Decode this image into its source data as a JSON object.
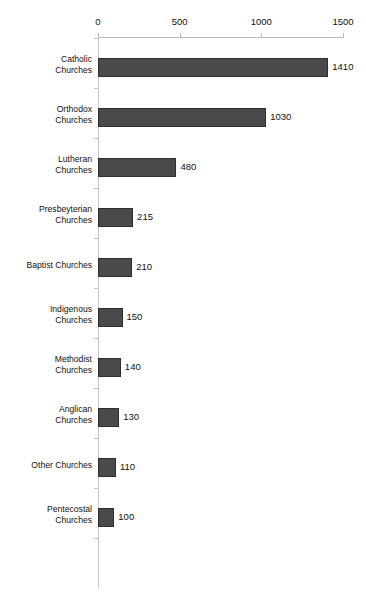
{
  "chart_data": {
    "type": "bar",
    "orientation": "horizontal",
    "title": "",
    "xlabel": "",
    "ylabel": "",
    "xlim": [
      0,
      1500
    ],
    "xticks": [
      0,
      500,
      1000,
      1500
    ],
    "xtick_labels": [
      "0",
      "500",
      "1000",
      "1500"
    ],
    "grid": false,
    "legend": "none",
    "axis_position": "top",
    "bar_color": "#4a4a4a",
    "bar_border_color": "#2e2e2e",
    "axis_color": "#b9b9b9",
    "background": "#ffffff",
    "show_value_labels": true,
    "categories": [
      "Catholic Churches",
      "Orthodox Churches",
      "Lutheran Churches",
      "Presbeyterian Churches",
      "Baptist Churches",
      "Indigenous Churches",
      "Methodist Churches",
      "Anglican Churches",
      "Other Churches",
      "Pentecostal Churches"
    ],
    "values": [
      1410,
      1030,
      480,
      215,
      210,
      150,
      140,
      130,
      110,
      100
    ],
    "bars": [
      {
        "label_line1": "Catholic",
        "label_line2": "Churches",
        "value": 1410,
        "value_label": "1410"
      },
      {
        "label_line1": "Orthodox",
        "label_line2": "Churches",
        "value": 1030,
        "value_label": "1030"
      },
      {
        "label_line1": "Lutheran",
        "label_line2": "Churches",
        "value": 480,
        "value_label": "480"
      },
      {
        "label_line1": "Presbeyterian",
        "label_line2": "Churches",
        "value": 215,
        "value_label": "215"
      },
      {
        "label_line1": "Baptist Churches",
        "label_line2": "",
        "value": 210,
        "value_label": "210"
      },
      {
        "label_line1": "Indigenous",
        "label_line2": "Churches",
        "value": 150,
        "value_label": "150"
      },
      {
        "label_line1": "Methodist",
        "label_line2": "Churches",
        "value": 140,
        "value_label": "140"
      },
      {
        "label_line1": "Anglican",
        "label_line2": "Churches",
        "value": 130,
        "value_label": "130"
      },
      {
        "label_line1": "Other Churches",
        "label_line2": "",
        "value": 110,
        "value_label": "110"
      },
      {
        "label_line1": "Pentecostal",
        "label_line2": "Churches",
        "value": 100,
        "value_label": "100"
      }
    ]
  }
}
